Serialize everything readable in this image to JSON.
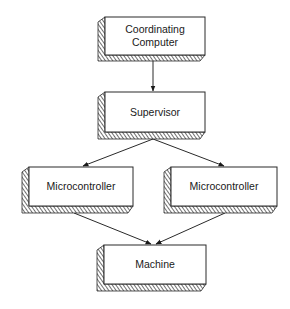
{
  "diagram": {
    "type": "hierarchy",
    "colors": {
      "line": "#2a2a2a",
      "face": "#ffffff",
      "hatch": "#333333"
    },
    "nodes": [
      {
        "id": "coordinating-computer",
        "lines": [
          "Coordinating",
          "Computer"
        ]
      },
      {
        "id": "supervisor",
        "lines": [
          "Supervisor"
        ]
      },
      {
        "id": "microcontroller-left",
        "lines": [
          "Microcontroller"
        ]
      },
      {
        "id": "microcontroller-right",
        "lines": [
          "Microcontroller"
        ]
      },
      {
        "id": "machine",
        "lines": [
          "Machine"
        ]
      }
    ],
    "edges": [
      {
        "from": "coordinating-computer",
        "to": "supervisor"
      },
      {
        "from": "supervisor",
        "to": "microcontroller-left"
      },
      {
        "from": "supervisor",
        "to": "microcontroller-right"
      },
      {
        "from": "microcontroller-left",
        "to": "machine"
      },
      {
        "from": "microcontroller-right",
        "to": "machine"
      }
    ]
  }
}
